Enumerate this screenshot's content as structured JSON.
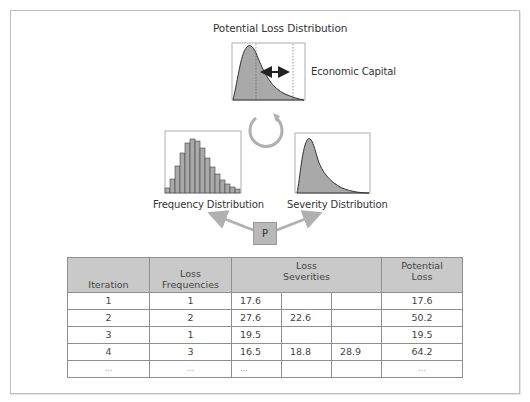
{
  "diagram": {
    "title": "Potential Loss Distribution",
    "economic_capital_label": "Economic Capital",
    "frequency_label": "Frequency Distribution",
    "severity_label": "Severity Distribution",
    "process_box_label": "P",
    "colors": {
      "fill": "#a9a9a9",
      "outline": "#333333",
      "arrow": "#b0b0b0",
      "header_bg": "#c9c9c9"
    }
  },
  "table": {
    "headers": {
      "iteration": "Iteration",
      "frequencies_line1": "Loss",
      "frequencies_line2": "Frequencies",
      "severities_line1": "Loss",
      "severities_line2": "Severities",
      "potential_line1": "Potential",
      "potential_line2": "Loss"
    },
    "rows": [
      {
        "iteration": "1",
        "frequency": "1",
        "s1": "17.6",
        "s2": "",
        "s3": "",
        "potential": "17.6"
      },
      {
        "iteration": "2",
        "frequency": "2",
        "s1": "27.6",
        "s2": "22.6",
        "s3": "",
        "potential": "50.2"
      },
      {
        "iteration": "3",
        "frequency": "1",
        "s1": "19.5",
        "s2": "",
        "s3": "",
        "potential": "19.5"
      },
      {
        "iteration": "4",
        "frequency": "3",
        "s1": "16.5",
        "s2": "18.8",
        "s3": "28.9",
        "potential": "64.2"
      },
      {
        "iteration": "...",
        "frequency": "...",
        "s1": "...",
        "s2": "",
        "s3": "",
        "potential": "..."
      }
    ]
  }
}
